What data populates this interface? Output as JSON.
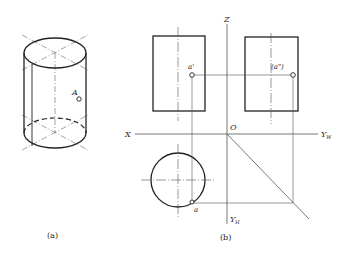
{
  "figure_a": {
    "caption": "(a)",
    "point_label": "A"
  },
  "figure_b": {
    "caption": "(b)",
    "axes": {
      "z": "Z",
      "x": "X",
      "origin": "O",
      "yw": "Y",
      "yw_sub": "W",
      "yh": "Y",
      "yh_sub": "H"
    },
    "front_point_label": "a'",
    "side_point_label": "(a\")",
    "top_point_label": "a"
  },
  "colors": {
    "stroke": "#222222",
    "thin": "#555555",
    "background": "#ffffff"
  }
}
